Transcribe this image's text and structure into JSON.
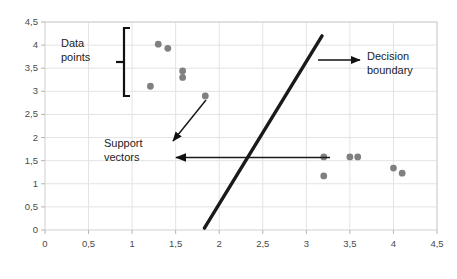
{
  "figure": {
    "caption_label": "FIGURE 3.6"
  },
  "annotations": {
    "data_points": "Data\npoints",
    "decision_boundary": "Decision\nboundary",
    "support_vectors": "Support\nvectors"
  },
  "chart_data": {
    "type": "scatter",
    "title": "",
    "xlabel": "",
    "ylabel": "",
    "xlim": [
      0,
      4.5
    ],
    "ylim": [
      0,
      4.5
    ],
    "grid": true,
    "legend": "none",
    "xticks": [
      "0",
      "0,5",
      "1",
      "1,5",
      "2",
      "2,5",
      "3",
      "3,5",
      "4",
      "4,5"
    ],
    "xtick_values": [
      0,
      0.5,
      1,
      1.5,
      2,
      2.5,
      3,
      3.5,
      4,
      4.5
    ],
    "yticks": [
      "0",
      "0,5",
      "1",
      "1,5",
      "2",
      "2,5",
      "3",
      "3,5",
      "4",
      "4,5"
    ],
    "ytick_values": [
      0,
      0.5,
      1,
      1.5,
      2,
      2.5,
      3,
      3.5,
      4,
      4.5
    ],
    "point_color": "#808080",
    "point_radius": 3.4,
    "series": [
      {
        "name": "class-a",
        "points": [
          [
            1.3,
            4.02
          ],
          [
            1.41,
            3.93
          ],
          [
            1.58,
            3.44
          ],
          [
            1.58,
            3.3
          ],
          [
            1.21,
            3.11
          ],
          [
            1.84,
            2.9
          ]
        ]
      },
      {
        "name": "class-b",
        "points": [
          [
            3.2,
            1.58
          ],
          [
            3.2,
            1.17
          ],
          [
            3.5,
            1.58
          ],
          [
            3.59,
            1.58
          ],
          [
            4.0,
            1.34
          ],
          [
            4.1,
            1.23
          ]
        ]
      }
    ],
    "decision_boundary": {
      "label": "Decision boundary",
      "color": "#1a1a1a",
      "width": 3.4,
      "x1": 1.83,
      "y1": 0.04,
      "x2": 3.18,
      "y2": 4.2
    },
    "annotation_markers": [
      {
        "name": "data-points-bracket",
        "kind": "bracket",
        "color": "#111111"
      },
      {
        "name": "decision-boundary-arrow",
        "kind": "arrow",
        "color": "#111111"
      },
      {
        "name": "support-vectors-arrow-left",
        "kind": "arrow",
        "color": "#111111"
      },
      {
        "name": "support-vectors-arrow-diagonal",
        "kind": "arrow",
        "color": "#111111"
      }
    ]
  }
}
